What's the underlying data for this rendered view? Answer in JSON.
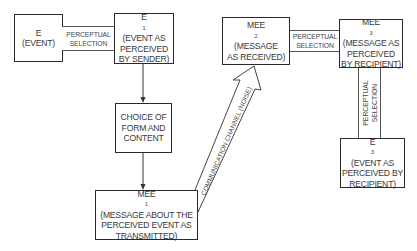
{
  "boxes": {
    "e": {
      "symbol": "E",
      "subscript": "",
      "lines": [
        "(EVENT)"
      ]
    },
    "e1": {
      "symbol": "E",
      "subscript": "1",
      "lines": [
        "(EVENT AS",
        "PERCEIVED",
        "BY SENDER)"
      ]
    },
    "choice": {
      "lines": [
        "CHOICE OF",
        "FORM AND",
        "CONTENT"
      ]
    },
    "mee1": {
      "symbol": "MEE",
      "subscript": "1",
      "lines": [
        "(MESSAGE ABOUT THE",
        "PERCEIVED EVENT AS",
        "TRANSMITTED)"
      ]
    },
    "mee2": {
      "symbol": "MEE",
      "subscript": "2",
      "lines": [
        "(MESSAGE",
        "AS RECEIVED)"
      ]
    },
    "mee3": {
      "symbol": "MEE",
      "subscript": "3",
      "lines": [
        "(MESSAGE AS",
        "PERCEIVED",
        "BY RECIPIENT)"
      ]
    },
    "e3": {
      "symbol": "E",
      "subscript": "3",
      "lines": [
        "(EVENT AS",
        "PERCEIVED BY",
        "RECIPIENT)"
      ]
    }
  },
  "channels": {
    "perceptual_1": {
      "lines": [
        "PERCEPTUAL",
        "SELECTION"
      ]
    },
    "perceptual_2": {
      "lines": [
        "PERCEPTUAL",
        "SELECTION"
      ]
    },
    "perceptual_3": {
      "lines": [
        "PERCEPTUAL",
        "SELECTION"
      ]
    },
    "communication": {
      "label": "COMMUNICATION CHANNEL (NOISE)"
    }
  }
}
